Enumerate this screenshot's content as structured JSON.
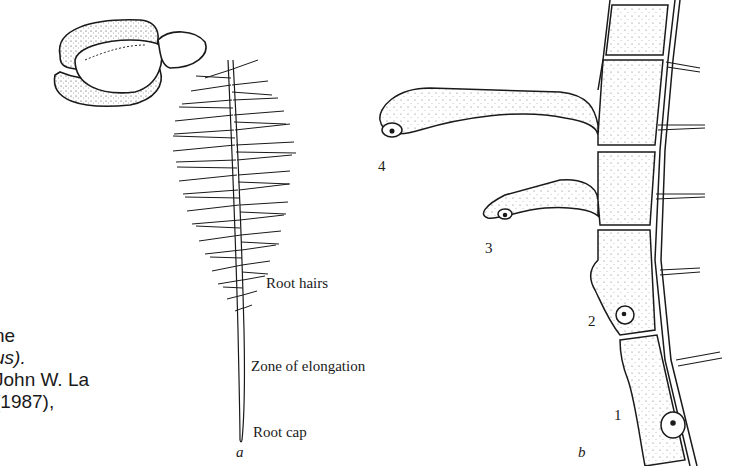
{
  "figure": {
    "caption_fragments": [
      {
        "text": "ne",
        "italic": false
      },
      {
        "text": "us).",
        "italic": true
      },
      {
        "text": "John W. La",
        "italic": false
      },
      {
        "text": "(1987),",
        "italic": false
      }
    ],
    "panel_a": {
      "letter": "a",
      "labels": {
        "root_hairs": "Root hairs",
        "zone_of_elongation": "Zone of elongation",
        "root_cap": "Root cap"
      }
    },
    "panel_b": {
      "letter": "b",
      "stage_numbers": [
        "1",
        "2",
        "3",
        "4"
      ]
    },
    "colors": {
      "ink": "#1a1a1a",
      "background": "#ffffff"
    }
  }
}
